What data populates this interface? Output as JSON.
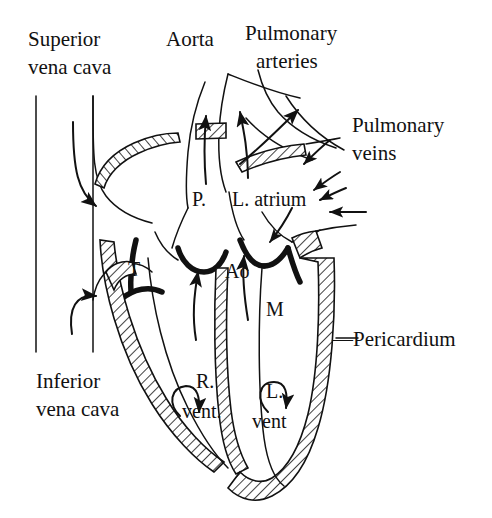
{
  "figure": {
    "style": "black-and-white line drawing",
    "background_color": "#ffffff",
    "ink_color": "#111111",
    "width": 492,
    "height": 518
  },
  "labels": {
    "superior_vena_cava_line1": "Superior",
    "superior_vena_cava_line2": "vena cava",
    "aorta": "Aorta",
    "pulmonary_arteries_line1": "Pulmonary",
    "pulmonary_arteries_line2": "arteries",
    "pulmonary_veins_line1": "Pulmonary",
    "pulmonary_veins_line2": "veins",
    "left_atrium": "L. atrium",
    "pulmonary_valve": "P.",
    "aortic_valve": "Ao",
    "tricuspid_valve": "T",
    "mitral_valve": "M",
    "right_ventricle_line1": "R.",
    "right_ventricle_line2": "vent.",
    "left_ventricle_line1": "L.",
    "left_ventricle_line2": "vent",
    "inferior_vena_cava_line1": "Inferior",
    "inferior_vena_cava_line2": "vena cava",
    "pericardium": "—Pericardium"
  },
  "legend_meaning": {
    "P.": "Pulmonary valve",
    "Ao": "Aortic valve",
    "T": "Tricuspid valve",
    "M": "Mitral valve",
    "R. vent.": "Right ventricle",
    "L. vent": "Left ventricle"
  }
}
